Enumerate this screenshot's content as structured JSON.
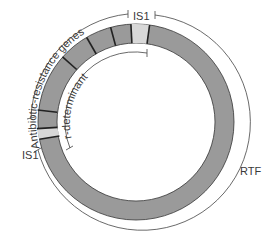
{
  "diagram": {
    "type": "plasmid-map",
    "labels": {
      "is1_top": "IS1",
      "is1_left": "IS1",
      "antibiotic_resistance": "Antibiotic-resistance genes",
      "r_determinant": "r-determinant",
      "rtf": "RTF"
    },
    "colors": {
      "ring": "#9a9a9a",
      "is_element": "#d8d8d8",
      "line": "#333333"
    }
  }
}
